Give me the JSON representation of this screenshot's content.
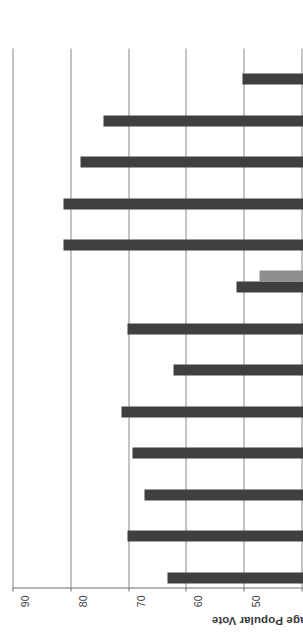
{
  "chart_data": {
    "type": "bar",
    "title": "",
    "xlabel": "Election",
    "ylabel": "Percentage Popular Vote",
    "ylim": [
      0,
      90
    ],
    "ytick_step": 10,
    "yticks": [
      0,
      10,
      20,
      30,
      40,
      50,
      60,
      70,
      80,
      90
    ],
    "grid": true,
    "legend_position": "bottom",
    "categories": [
      "1900",
      "1904",
      "1908",
      "1912",
      "1916",
      "1920",
      "1924",
      "1928",
      "1932",
      "1936",
      "1940",
      "1944",
      "1948"
    ],
    "series": [
      {
        "name": "Democratic",
        "color": "#3f3f3f",
        "values": [
          63,
          70,
          67,
          69,
          71,
          62,
          70,
          51,
          81,
          81,
          78,
          74,
          50
        ]
      },
      {
        "name": "Republican",
        "color": "#8e8e8e",
        "values": [
          36,
          31,
          33,
          10,
          34,
          37,
          28,
          47,
          19,
          18,
          21,
          26,
          26
        ]
      },
      {
        "name": "Third Party",
        "color": "#d4d4d4",
        "values": [
          0,
          0,
          0,
          15,
          0,
          0,
          0,
          0,
          0,
          0,
          0,
          0,
          22
        ]
      }
    ]
  },
  "legend": {
    "items": [
      {
        "label": "Democratic",
        "swatch": "dem"
      },
      {
        "label": "Republican",
        "swatch": "rep"
      },
      {
        "label": "Third Party",
        "swatch": "third"
      }
    ]
  }
}
